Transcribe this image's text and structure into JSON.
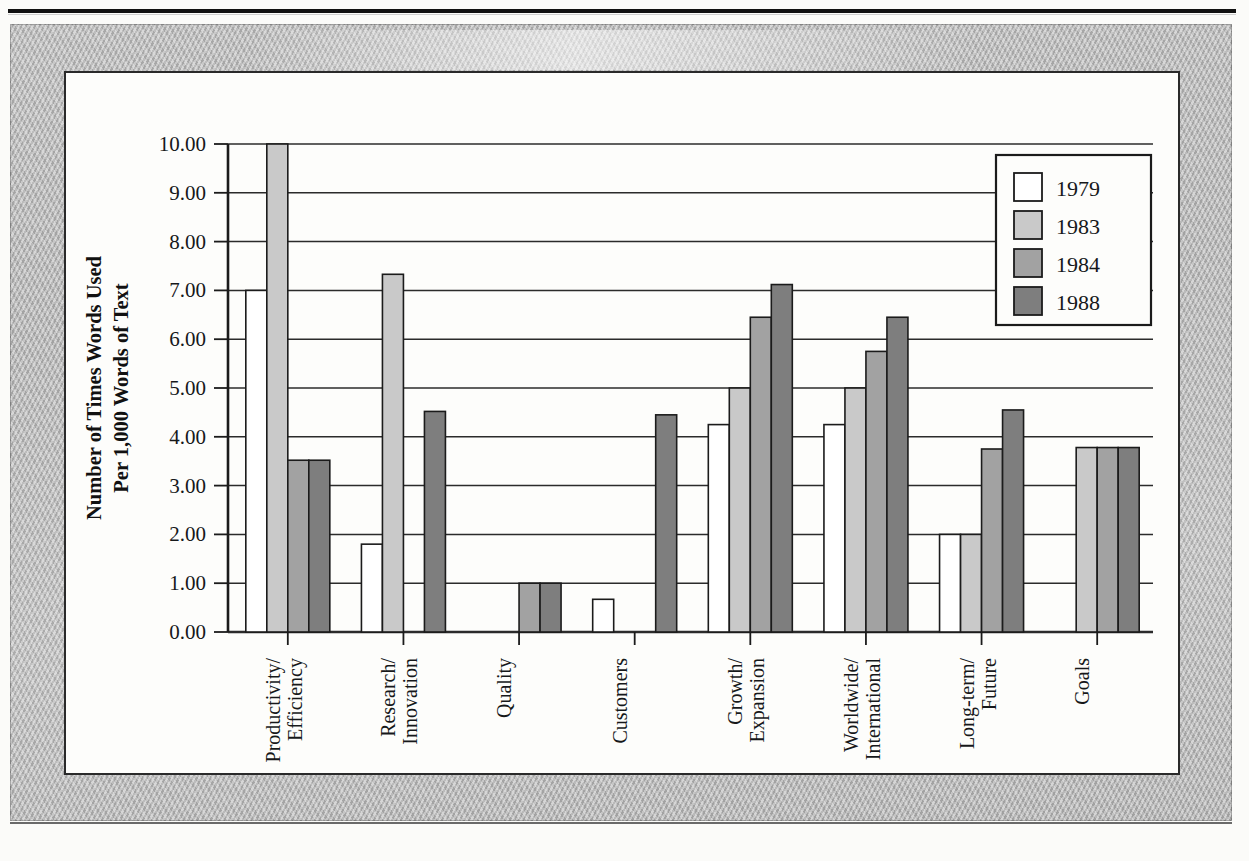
{
  "chart_data": {
    "type": "bar",
    "title": "",
    "xlabel": "",
    "ylabel": "Number of Times Words Used Per 1,000 Words of Text",
    "ylabel_line1": "Number of Times Words Used",
    "ylabel_line2": "Per 1,000 Words of Text",
    "ylim": [
      0,
      10
    ],
    "ytick_step": 1,
    "ytick_labels": [
      "10.00",
      "9.00",
      "8.00",
      "7.00",
      "6.00",
      "5.00",
      "4.00",
      "3.00",
      "2.00",
      "1.00",
      "0.00"
    ],
    "ytick_values": [
      10,
      9,
      8,
      7,
      6,
      5,
      4,
      3,
      2,
      1,
      0
    ],
    "grid": true,
    "legend_position": "top-right",
    "categories": [
      "Productivity/Efficiency",
      "Research/Innovation",
      "Quality",
      "Customers",
      "Growth/Expansion",
      "Worldwide/International",
      "Long-term/Future",
      "Goals"
    ],
    "category_lines": [
      [
        "Productivity/",
        "Efficiency"
      ],
      [
        "Research/",
        "Innovation"
      ],
      [
        "Quality",
        ""
      ],
      [
        "Customers",
        ""
      ],
      [
        "Growth/",
        "Expansion"
      ],
      [
        "Worldwide/",
        "International"
      ],
      [
        "Long-term/",
        "Future"
      ],
      [
        "Goals",
        ""
      ]
    ],
    "series": [
      {
        "name": "1979",
        "color": "#ffffff",
        "values": [
          7.0,
          1.8,
          0.0,
          0.67,
          4.25,
          4.25,
          2.0,
          0.0
        ]
      },
      {
        "name": "1983",
        "color": "#c9c9c9",
        "values": [
          10.0,
          7.33,
          0.0,
          0.0,
          5.0,
          5.0,
          2.0,
          3.78
        ]
      },
      {
        "name": "1984",
        "color": "#a2a2a2",
        "values": [
          3.52,
          0.0,
          1.0,
          0.0,
          6.45,
          5.75,
          3.75,
          3.78
        ]
      },
      {
        "name": "1988",
        "color": "#7e7e7e",
        "values": [
          3.52,
          4.52,
          1.0,
          4.45,
          7.12,
          6.45,
          4.55,
          3.78
        ]
      }
    ]
  },
  "legend": {
    "entries": [
      {
        "label": "1979",
        "color": "#ffffff"
      },
      {
        "label": "1983",
        "color": "#c9c9c9"
      },
      {
        "label": "1984",
        "color": "#a2a2a2"
      },
      {
        "label": "1988",
        "color": "#7e7e7e"
      }
    ]
  },
  "colors": {
    "axis": "#1b1b1b",
    "grid": "#2b2b2b",
    "bar_stroke": "#1b1b1b",
    "frame": "#b6b6b6",
    "canvas": "#fdfdfb"
  }
}
